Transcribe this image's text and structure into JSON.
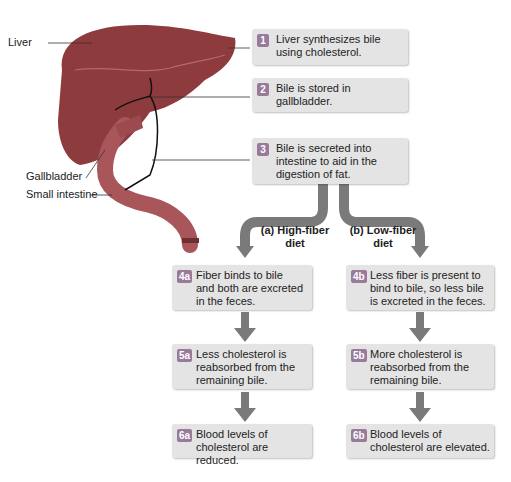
{
  "labels": {
    "liver": "Liver",
    "gallbladder": "Gallbladder",
    "small_intestine": "Small intestine"
  },
  "steps": [
    {
      "badge": "1",
      "text": [
        "Liver synthesizes bile",
        "using cholesterol."
      ]
    },
    {
      "badge": "2",
      "text": [
        "Bile is stored in",
        "gallbladder."
      ]
    },
    {
      "badge": "3",
      "text": [
        "Bile is secreted into",
        "intestine to aid in the",
        "digestion of fat."
      ]
    }
  ],
  "branches": {
    "a": {
      "label": [
        "(a) High-fiber",
        "diet"
      ],
      "steps": [
        {
          "badge": "4a",
          "text": [
            "Fiber binds to bile",
            "and both are excreted",
            "in the feces."
          ]
        },
        {
          "badge": "5a",
          "text": [
            "Less cholesterol is",
            "reabsorbed from the",
            "remaining bile."
          ]
        },
        {
          "badge": "6a",
          "text": [
            "Blood levels of",
            "cholesterol are reduced."
          ]
        }
      ]
    },
    "b": {
      "label": [
        "(b) Low-fiber",
        "diet"
      ],
      "steps": [
        {
          "badge": "4b",
          "text": [
            "Less fiber is present to",
            "bind to bile, so less bile",
            "is excreted in the feces."
          ]
        },
        {
          "badge": "5b",
          "text": [
            "More cholesterol is",
            "reabsorbed from the",
            "remaining bile."
          ]
        },
        {
          "badge": "6b",
          "text": [
            "Blood levels of",
            "cholesterol are elevated."
          ]
        }
      ]
    }
  },
  "colors": {
    "liver": "#8e3b3e",
    "intestine": "#a9565b",
    "box": "#e4e4e4",
    "badge": "#9a7a9a",
    "arrow": "#7a7a7a"
  }
}
